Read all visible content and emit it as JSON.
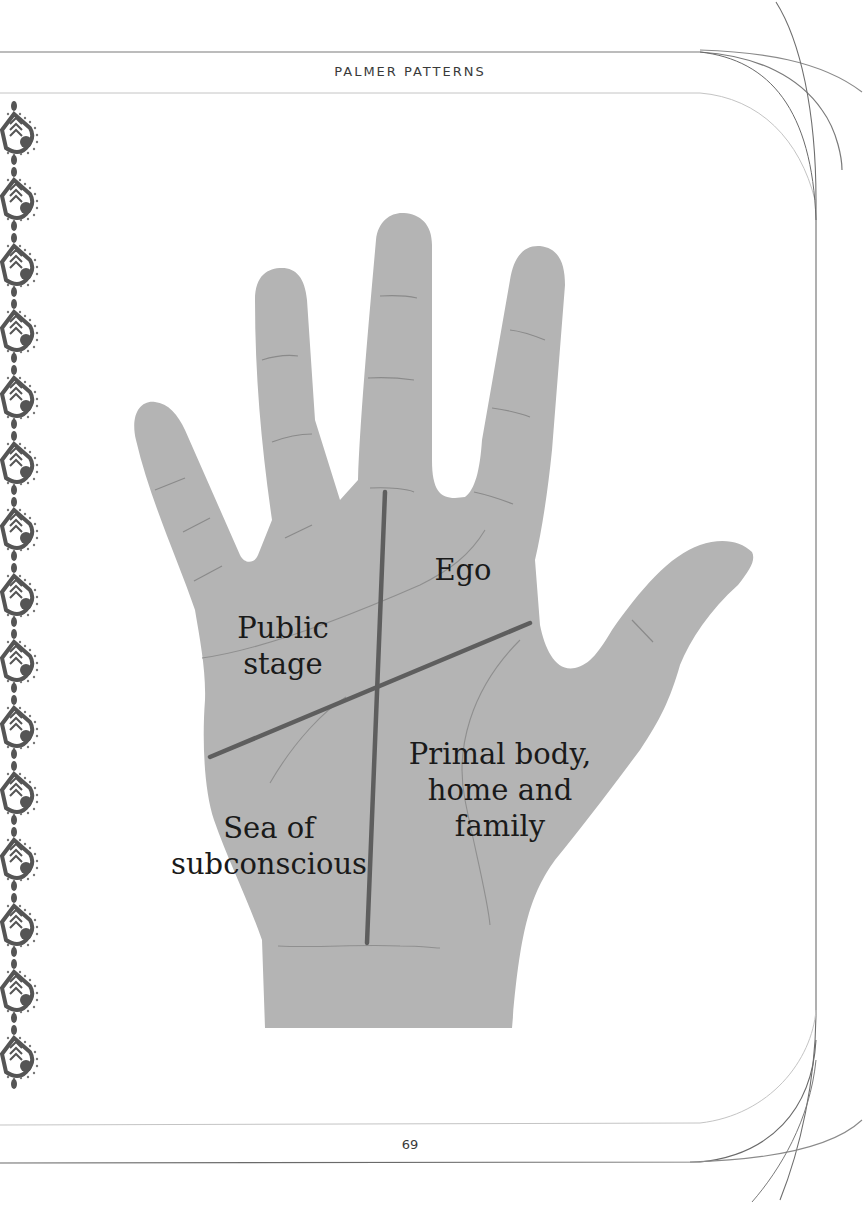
{
  "header": {
    "running_title": "PALMER PATTERNS"
  },
  "footer": {
    "page_number": "69"
  },
  "illustration": {
    "subject": "hand-palm-quadrants",
    "colors": {
      "skin": "#b4b4b4",
      "major_line": "#5e5e5e",
      "minor_line": "#8a8a8a",
      "text": "#1a1a1a",
      "frame_line": "#7a7a7a"
    },
    "quadrants": [
      {
        "id": "ego",
        "label": "Ego"
      },
      {
        "id": "public-stage",
        "label": "Public\nstage"
      },
      {
        "id": "primal-body",
        "label": "Primal body,\nhome and\nfamily"
      },
      {
        "id": "sea-of-subconscious",
        "label": "Sea of\nsubconscious"
      }
    ]
  },
  "decoration": {
    "left_border": "paisley-motif-strip",
    "motif_count": 15
  }
}
